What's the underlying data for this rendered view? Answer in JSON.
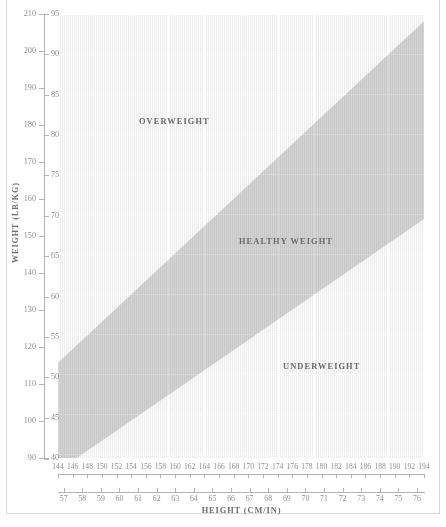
{
  "caption": "",
  "chart_data": {
    "type": "area",
    "xlabel": "HEIGHT (CM/IN)",
    "ylabel": "WEIGHT (LB/KG)",
    "grid": true,
    "legend_position": "in-plot annotations",
    "x_axis": {
      "primary_unit": "cm",
      "secondary_unit": "in",
      "xlim_cm": [
        144,
        194
      ],
      "xlim_in": [
        57,
        76
      ],
      "cm_ticks": [
        144,
        146,
        148,
        150,
        152,
        154,
        156,
        158,
        160,
        162,
        164,
        166,
        168,
        170,
        172,
        174,
        176,
        178,
        180,
        182,
        184,
        186,
        188,
        190,
        192,
        194
      ],
      "in_ticks": [
        57,
        58,
        59,
        60,
        61,
        62,
        63,
        64,
        65,
        66,
        67,
        68,
        69,
        70,
        71,
        72,
        73,
        74,
        75,
        76
      ]
    },
    "y_axis": {
      "primary_unit": "lb",
      "secondary_unit": "kg",
      "ylim_lb": [
        90,
        210
      ],
      "ylim_kg": [
        40,
        95
      ],
      "lb_ticks": [
        90,
        100,
        110,
        120,
        130,
        140,
        150,
        160,
        170,
        180,
        190,
        200,
        210
      ],
      "kg_ticks": [
        40,
        45,
        50,
        55,
        60,
        65,
        70,
        75,
        80,
        85,
        90,
        95
      ]
    },
    "regions": [
      {
        "name": "OVERWEIGHT",
        "label": "OVERWEIGHT",
        "bmi_range": "above 25",
        "fill": "#fbfbfb",
        "position": "upper-left of band"
      },
      {
        "name": "HEALTHY WEIGHT",
        "label": "HEALTHY WEIGHT",
        "bmi_range": "18.5 to 25",
        "fill": "#d0d0d0",
        "position": "diagonal band"
      },
      {
        "name": "UNDERWEIGHT",
        "label": "UNDERWEIGHT",
        "bmi_range": "below 18.5",
        "fill": "#fbfbfb",
        "position": "lower-right of band"
      }
    ],
    "band_boundaries": {
      "upper_bmi": 25,
      "lower_bmi": 18.5,
      "upper_line_kg_at_144cm": 51.8,
      "upper_line_kg_at_194cm": 94.1,
      "lower_line_kg_at_144cm": 38.4,
      "lower_line_kg_at_194cm": 69.6
    },
    "colors": {
      "band": "#d0d0d0",
      "plot_background": "#fbfbfb",
      "gridline": "#ffffff",
      "hatch": "#e4e4e4",
      "axis": "#b4b4b4",
      "label_text": "#8e8e8e",
      "title_text": "#6e6e6e",
      "region_text": "#6a6a6a",
      "page_border": "#d8d8d8"
    }
  }
}
